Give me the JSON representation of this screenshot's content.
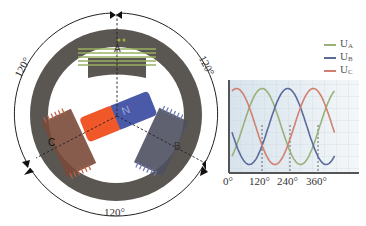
{
  "diagram": {
    "title": "",
    "stator": {
      "ring_color": "#5a5651",
      "angle_labels": [
        "120°",
        "120°",
        "120°"
      ]
    },
    "rotor": {
      "north_label": "N",
      "north_color": "#4a5aa8",
      "south_color": "#f0582a"
    },
    "coils": [
      {
        "label": "A",
        "color": "#8a9a4a"
      },
      {
        "label": "B",
        "color": "#5a6a9a"
      },
      {
        "label": "C",
        "color": "#a0503a"
      }
    ]
  },
  "chart_data": {
    "type": "line",
    "title": "",
    "xlabel": "",
    "ylabel": "",
    "x": [
      0,
      30,
      60,
      90,
      120,
      150,
      180,
      210,
      240,
      270,
      300,
      330,
      360,
      390,
      420
    ],
    "x_tick_labels": [
      "0°",
      "120°",
      "240°",
      "360°"
    ],
    "x_ticks": [
      0,
      120,
      240,
      360
    ],
    "grid": true,
    "legend_position": "top-right",
    "series": [
      {
        "name": "U_A",
        "label_main": "U",
        "label_sub": "A",
        "color": "#9ab07a",
        "values": [
          0,
          0.5,
          0.87,
          1,
          0.87,
          0.5,
          0,
          -0.5,
          -0.87,
          -1,
          -0.87,
          -0.5,
          0,
          0.5,
          0.87
        ]
      },
      {
        "name": "U_B",
        "label_main": "U",
        "label_sub": "B",
        "color": "#5a6a9a",
        "values": [
          -0.87,
          -1,
          -0.87,
          -0.5,
          0,
          0.5,
          0.87,
          1,
          0.87,
          0.5,
          0,
          -0.5,
          -0.87,
          -1,
          -0.87
        ]
      },
      {
        "name": "U_C",
        "label_main": "U",
        "label_sub": "C",
        "color": "#d08070",
        "values": [
          0.87,
          0.5,
          0,
          -0.5,
          -0.87,
          -1,
          -0.87,
          -0.5,
          0,
          0.5,
          0.87,
          1,
          0.87,
          0.5,
          0
        ]
      }
    ]
  }
}
